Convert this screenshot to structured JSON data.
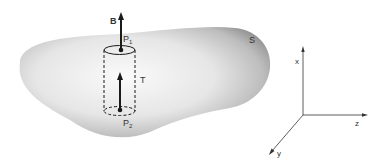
{
  "figure": {
    "surface_label": "S",
    "field_label": "B",
    "point_top_label": "P",
    "point_top_subscript": "1",
    "point_bottom_label": "P",
    "point_bottom_subscript": "2",
    "tube_label": "T",
    "axes": {
      "x_label": "x",
      "y_label": "y",
      "z_label": "z"
    }
  },
  "colors": {
    "ink": "#1a1a1a",
    "surface_light": "#f4f4f4",
    "surface_dark": "#8a8a8a"
  }
}
